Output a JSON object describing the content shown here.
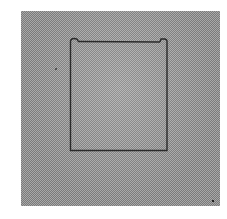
{
  "figure": {
    "background_color": "#a8a8a8",
    "dither_color": "#7a7a7a",
    "outline_color": "#2a2a2a"
  }
}
